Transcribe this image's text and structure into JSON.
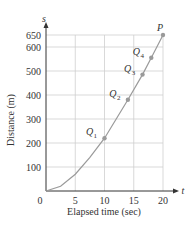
{
  "chart_data": {
    "type": "line",
    "title": "",
    "xlabel": "Elapsed time (sec)",
    "ylabel": "Distance (m)",
    "x_axis_symbol": "t",
    "y_axis_symbol": "s",
    "xlim": [
      0,
      20
    ],
    "ylim": [
      0,
      650
    ],
    "x_ticks": [
      0,
      5,
      10,
      15,
      20
    ],
    "x_tick_labels": [
      "0",
      "5",
      "10",
      "15",
      "20"
    ],
    "y_ticks": [
      100,
      200,
      300,
      400,
      500,
      600,
      650
    ],
    "y_tick_labels": [
      "100",
      "200",
      "300",
      "400",
      "500",
      "600",
      "650"
    ],
    "grid": true,
    "series": [
      {
        "name": "s(t)",
        "x": [
          0,
          2.5,
          5,
          7.5,
          10,
          12,
          14,
          16.5,
          18,
          20
        ],
        "y": [
          0,
          20,
          70,
          140,
          220,
          300,
          380,
          485,
          555,
          650
        ]
      }
    ],
    "points": [
      {
        "label": "Q",
        "sub": "1",
        "t": 10,
        "s": 220
      },
      {
        "label": "Q",
        "sub": "2",
        "t": 14,
        "s": 380
      },
      {
        "label": "Q",
        "sub": "3",
        "t": 16.5,
        "s": 485
      },
      {
        "label": "Q",
        "sub": "4",
        "t": 18,
        "s": 555
      },
      {
        "label": "P",
        "sub": "",
        "t": 20,
        "s": 650
      }
    ],
    "colors": {
      "curve": "#9a9a9a",
      "grid": "#cfcfcf",
      "axis": "#333333",
      "point": "#9a9a9a"
    }
  }
}
